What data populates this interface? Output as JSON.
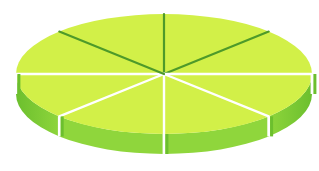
{
  "figure": {
    "type": "3d-pie-disc",
    "slice_count": 8,
    "slices": [
      {
        "index": 0,
        "share": 0.125
      },
      {
        "index": 1,
        "share": 0.125
      },
      {
        "index": 2,
        "share": 0.125
      },
      {
        "index": 3,
        "share": 0.125
      },
      {
        "index": 4,
        "share": 0.125
      },
      {
        "index": 5,
        "share": 0.125
      },
      {
        "index": 6,
        "share": 0.125
      },
      {
        "index": 7,
        "share": 0.125
      }
    ],
    "colors": {
      "top_face": "#d2f048",
      "side_face": "#8fd63c",
      "side_shadow": "#6cbf2e",
      "cut_line": "#4e9a2a",
      "background": "#ffffff"
    }
  }
}
